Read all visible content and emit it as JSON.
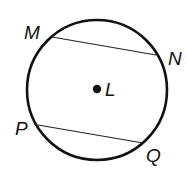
{
  "diagram": {
    "circle": {
      "center_label": "L",
      "cx": 97,
      "cy": 90,
      "r": 70
    },
    "points": [
      {
        "label": "M",
        "x": 52,
        "y": 37,
        "lx": 24,
        "ly": 39
      },
      {
        "label": "N",
        "x": 156,
        "y": 55,
        "lx": 168,
        "ly": 65
      },
      {
        "label": "P",
        "x": 38,
        "y": 125,
        "lx": 15,
        "ly": 135
      },
      {
        "label": "Q",
        "x": 143,
        "y": 143,
        "lx": 146,
        "ly": 162
      }
    ],
    "chords": [
      {
        "name": "MN",
        "from": "M",
        "to": "N"
      },
      {
        "name": "PQ",
        "from": "P",
        "to": "Q"
      }
    ],
    "colors": {
      "stroke": "#111111",
      "background": "#ffffff"
    }
  }
}
